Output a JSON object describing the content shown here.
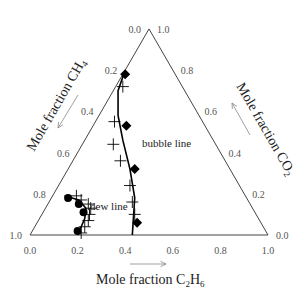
{
  "chart_data": {
    "type": "ternary-scatter",
    "components": {
      "bottom_left": "CH4",
      "bottom_right": "C2H6",
      "top": "CO2"
    },
    "axes": {
      "left": {
        "label": "Mole fraction CH",
        "sub": "4",
        "ticks": [
          "0.0",
          "0.2",
          "0.4",
          "0.6",
          "0.8",
          "1.0"
        ]
      },
      "right": {
        "label": "Mole fraction CO",
        "sub": "2",
        "ticks": [
          "1.0",
          "0.8",
          "0.6",
          "0.4",
          "0.2",
          "0.0"
        ]
      },
      "bottom": {
        "label_a": "Mole fraction C",
        "sub_a": "2",
        "label_b": "H",
        "sub_b": "6",
        "ticks": [
          "0.0",
          "0.2",
          "0.4",
          "0.6",
          "0.8",
          "1.0"
        ]
      }
    },
    "annotations": {
      "bubble": "bubble line",
      "dew": "dew line"
    },
    "series": [
      {
        "name": "bubble measured (diamond)",
        "marker": "diamond",
        "points": [
          [
            0.01,
            0.78
          ],
          [
            0.14,
            0.53
          ],
          [
            0.28,
            0.32
          ],
          [
            0.42,
            0.06
          ]
        ]
      },
      {
        "name": "bubble calc (plus)",
        "marker": "plus",
        "points": [
          [
            0.03,
            0.72
          ],
          [
            0.08,
            0.55
          ],
          [
            0.13,
            0.44
          ],
          [
            0.2,
            0.36
          ],
          [
            0.3,
            0.24
          ],
          [
            0.35,
            0.16
          ],
          [
            0.39,
            0.1
          ]
        ]
      },
      {
        "name": "dew measured (circle)",
        "marker": "circle",
        "points": [
          [
            0.07,
            0.18
          ],
          [
            0.13,
            0.15
          ],
          [
            0.17,
            0.11
          ],
          [
            0.19,
            0.02
          ]
        ]
      },
      {
        "name": "dew calc (plus)",
        "marker": "plus",
        "points": [
          [
            0.1,
            0.19
          ],
          [
            0.13,
            0.17
          ],
          [
            0.17,
            0.15
          ],
          [
            0.19,
            0.13
          ],
          [
            0.2,
            0.1
          ],
          [
            0.21,
            0.07
          ],
          [
            0.21,
            0.04
          ],
          [
            0.21,
            0.01
          ]
        ]
      }
    ],
    "curves": {
      "bubble": [
        [
          0.0,
          0.8
        ],
        [
          0.02,
          0.7
        ],
        [
          0.08,
          0.58
        ],
        [
          0.16,
          0.46
        ],
        [
          0.26,
          0.32
        ],
        [
          0.35,
          0.18
        ],
        [
          0.43,
          0.0
        ]
      ],
      "dew": [
        [
          0.05,
          0.19
        ],
        [
          0.12,
          0.17
        ],
        [
          0.17,
          0.13
        ],
        [
          0.19,
          0.08
        ],
        [
          0.2,
          0.0
        ]
      ]
    }
  }
}
